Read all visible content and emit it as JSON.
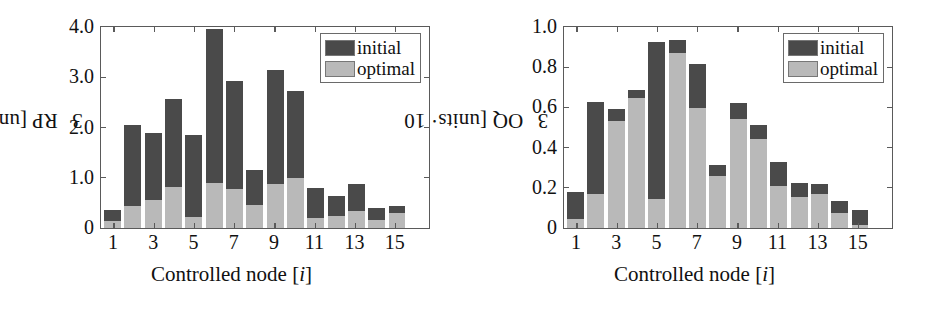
{
  "figure": {
    "panels": [
      {
        "id": "rp-panel",
        "ylabel_text": "RP [units· 10",
        "ylabel_exp": "3",
        "ylabel_close": "]",
        "xlabel_pre": "Controlled node [",
        "xlabel_ital": "i",
        "xlabel_post": "]",
        "legend": {
          "initial": "initial",
          "optimal": "optimal"
        }
      },
      {
        "id": "oq-panel",
        "ylabel_text": "OQ [units· 10",
        "ylabel_exp": "3",
        "ylabel_close": "]",
        "xlabel_pre": "Controlled node [",
        "xlabel_ital": "i",
        "xlabel_post": "]",
        "legend": {
          "initial": "initial",
          "optimal": "optimal"
        }
      }
    ]
  },
  "colors": {
    "initial": "#4a4a4a",
    "optimal": "#b9b9b9",
    "axis": "#5a5a5a",
    "text": "#111111",
    "background": "#ffffff"
  },
  "chart_data": [
    {
      "type": "bar",
      "stacked": true,
      "id": "rp-panel",
      "title": "",
      "xlabel": "Controlled node [i]",
      "ylabel": "RP [units· 10^3]",
      "ylim": [
        0,
        4.0
      ],
      "yticks": [
        0,
        1.0,
        2.0,
        3.0,
        4.0
      ],
      "yticklabels": [
        "0",
        "1.0",
        "2.0",
        "3.0",
        "4.0"
      ],
      "xticks": [
        1,
        3,
        5,
        7,
        9,
        11,
        13,
        15
      ],
      "xticklabels": [
        "1",
        "3",
        "5",
        "7",
        "9",
        "11",
        "13",
        "15"
      ],
      "categories": [
        1,
        2,
        3,
        4,
        5,
        6,
        7,
        8,
        9,
        10,
        11,
        12,
        13,
        14,
        15,
        16
      ],
      "grid": false,
      "legend_position": "upper right",
      "series": [
        {
          "name": "initial",
          "values": [
            0.35,
            2.05,
            1.9,
            2.56,
            1.86,
            3.96,
            2.92,
            1.15,
            3.15,
            2.72,
            0.79,
            0.63,
            0.87,
            0.4,
            0.44,
            0.0
          ]
        },
        {
          "name": "optimal",
          "values": [
            0.14,
            0.44,
            0.56,
            0.82,
            0.22,
            0.9,
            0.78,
            0.45,
            0.88,
            1.0,
            0.2,
            0.23,
            0.33,
            0.15,
            0.3,
            0.0
          ]
        }
      ]
    },
    {
      "type": "bar",
      "stacked": true,
      "id": "oq-panel",
      "title": "",
      "xlabel": "Controlled node [i]",
      "ylabel": "OQ [units· 10^3]",
      "ylim": [
        0,
        1.0
      ],
      "yticks": [
        0,
        0.2,
        0.4,
        0.6,
        0.8,
        1.0
      ],
      "yticklabels": [
        "0",
        "0.2",
        "0.4",
        "0.6",
        "0.8",
        "1.0"
      ],
      "xticks": [
        1,
        3,
        5,
        7,
        9,
        11,
        13,
        15
      ],
      "xticklabels": [
        "1",
        "3",
        "5",
        "7",
        "9",
        "11",
        "13",
        "15"
      ],
      "categories": [
        1,
        2,
        3,
        4,
        5,
        6,
        7,
        8,
        9,
        10,
        11,
        12,
        13,
        14,
        15,
        16
      ],
      "grid": false,
      "legend_position": "upper right",
      "series": [
        {
          "name": "initial",
          "values": [
            0.18,
            0.625,
            0.59,
            0.685,
            0.925,
            0.935,
            0.815,
            0.315,
            0.62,
            0.515,
            0.33,
            0.225,
            0.22,
            0.135,
            0.09,
            0.0
          ]
        },
        {
          "name": "optimal",
          "values": [
            0.045,
            0.17,
            0.53,
            0.645,
            0.145,
            0.87,
            0.595,
            0.26,
            0.54,
            0.445,
            0.21,
            0.155,
            0.17,
            0.075,
            0.015,
            0.0
          ]
        }
      ]
    }
  ]
}
